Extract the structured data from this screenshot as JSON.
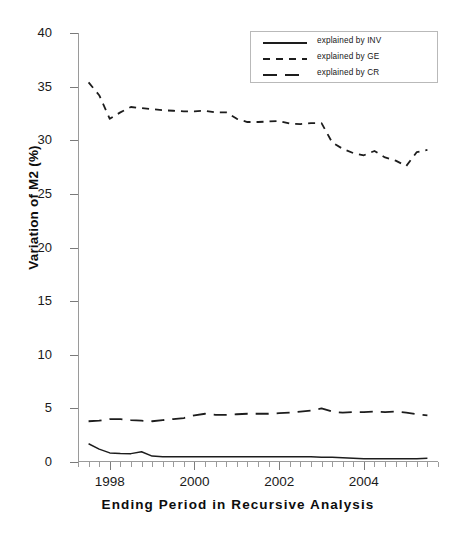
{
  "chart_data": {
    "type": "line",
    "title": "",
    "xlabel": "Ending Period in Recursive Analysis",
    "ylabel": "Variation of M2 (%)",
    "xlim": [
      1997.25,
      2005.75
    ],
    "ylim": [
      0,
      40
    ],
    "yticks": [
      0,
      5,
      10,
      15,
      20,
      25,
      30,
      35,
      40
    ],
    "xticks_major": [
      1998,
      2000,
      2002,
      2004
    ],
    "xticklabels": [
      "1998",
      "2000",
      "2002",
      "2004"
    ],
    "xticks_minor_step": 0.25,
    "grid": false,
    "legend_position": "upper right",
    "x": [
      1997.5,
      1997.75,
      1998.0,
      1998.25,
      1998.5,
      1998.75,
      1999.0,
      1999.25,
      1999.5,
      1999.75,
      2000.0,
      2000.25,
      2000.5,
      2000.75,
      2001.0,
      2001.25,
      2001.5,
      2001.75,
      2002.0,
      2002.25,
      2002.5,
      2002.75,
      2003.0,
      2003.25,
      2003.5,
      2003.75,
      2004.0,
      2004.25,
      2004.5,
      2004.75,
      2005.0,
      2005.25,
      2005.5
    ],
    "series": [
      {
        "name": "explained by INV",
        "style": "solid",
        "values": [
          1.7,
          1.2,
          0.85,
          0.8,
          0.78,
          0.95,
          0.55,
          0.5,
          0.5,
          0.5,
          0.5,
          0.5,
          0.5,
          0.5,
          0.5,
          0.5,
          0.5,
          0.5,
          0.48,
          0.48,
          0.48,
          0.48,
          0.45,
          0.45,
          0.4,
          0.35,
          0.3,
          0.3,
          0.3,
          0.3,
          0.3,
          0.3,
          0.35
        ]
      },
      {
        "name": "explained by GE",
        "style": "dashed-short",
        "values": [
          35.4,
          34.2,
          32.0,
          32.6,
          33.1,
          33.0,
          32.9,
          32.8,
          32.75,
          32.7,
          32.7,
          32.75,
          32.6,
          32.6,
          32.0,
          31.7,
          31.7,
          31.75,
          31.8,
          31.55,
          31.5,
          31.6,
          31.6,
          29.8,
          29.2,
          28.8,
          28.6,
          29.0,
          28.4,
          28.1,
          27.6,
          28.9,
          29.1
        ]
      },
      {
        "name": "explained by CR",
        "style": "dashed-long",
        "values": [
          3.8,
          3.85,
          4.0,
          4.0,
          3.9,
          3.85,
          3.8,
          3.9,
          4.0,
          4.1,
          4.35,
          4.5,
          4.4,
          4.4,
          4.45,
          4.5,
          4.5,
          4.5,
          4.55,
          4.6,
          4.7,
          4.8,
          5.0,
          4.7,
          4.6,
          4.65,
          4.65,
          4.7,
          4.65,
          4.7,
          4.6,
          4.45,
          4.35
        ]
      }
    ]
  },
  "legend": {
    "items": [
      {
        "label": "explained by INV",
        "sample": "solid-line-sample"
      },
      {
        "label": "explained by GE",
        "sample": "short-dashed-line-sample"
      },
      {
        "label": "explained by CR",
        "sample": "long-dashed-line-sample"
      }
    ]
  }
}
